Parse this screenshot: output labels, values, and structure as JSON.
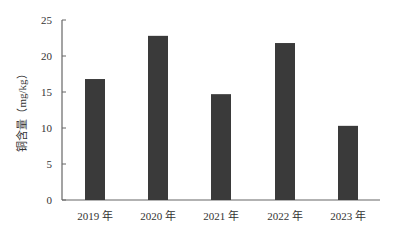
{
  "chart_data": {
    "type": "bar",
    "title": "",
    "xlabel": "",
    "ylabel": "铜含量（mg/kg）",
    "categories": [
      "2019 年",
      "2020 年",
      "2021 年",
      "2022 年",
      "2023 年"
    ],
    "values": [
      16.8,
      22.8,
      14.7,
      21.8,
      10.3
    ],
    "ylim": [
      0,
      25
    ],
    "yticks": [
      0,
      5,
      10,
      15,
      20,
      25
    ],
    "grid": false,
    "legend": null,
    "bar_color": "#3a3a3a"
  },
  "axis": {
    "y_title": "铜含量（mg/kg）"
  }
}
